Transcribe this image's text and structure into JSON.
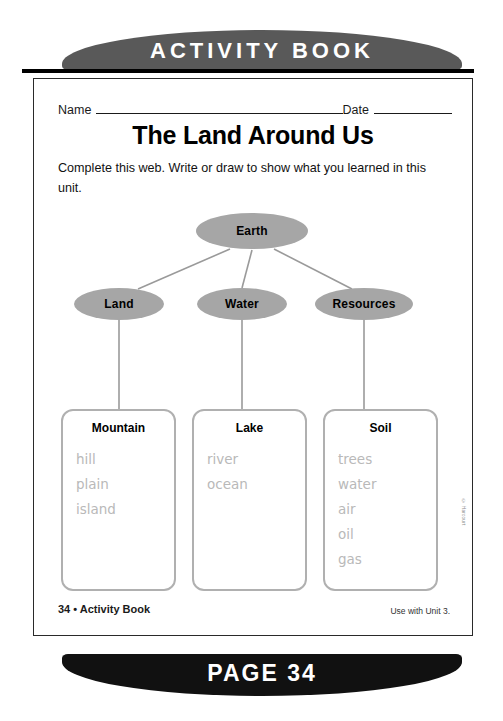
{
  "top_banner": {
    "text": "ACTIVITY BOOK"
  },
  "bottom_banner": {
    "text": "PAGE 34"
  },
  "worksheet": {
    "name_label": "Name",
    "date_label": "Date",
    "title": "The Land Around Us",
    "instructions": "Complete this web. Write or draw to show what you learned in this unit."
  },
  "diagram": {
    "root": {
      "label": "Earth"
    },
    "branches": [
      {
        "label": "Land"
      },
      {
        "label": "Water"
      },
      {
        "label": "Resources"
      }
    ],
    "boxes": [
      {
        "heading": "Mountain",
        "answers": [
          "hill",
          "plain",
          "island"
        ]
      },
      {
        "heading": "Lake",
        "answers": [
          "river",
          "ocean"
        ]
      },
      {
        "heading": "Soil",
        "answers": [
          "trees",
          "water",
          "air",
          "oil",
          "gas"
        ]
      }
    ]
  },
  "footer": {
    "page_credit": "34 • Activity Book",
    "unit_note": "Use with Unit 3.",
    "copyright": "© Harcourt"
  },
  "colors": {
    "top_banner_fill": "#595959",
    "bottom_banner_fill": "#111111",
    "oval_fill": "#a6a6a6",
    "box_border": "#b0b0b0",
    "answer_text": "#b9b9b9",
    "connector": "#9a9a9a"
  }
}
